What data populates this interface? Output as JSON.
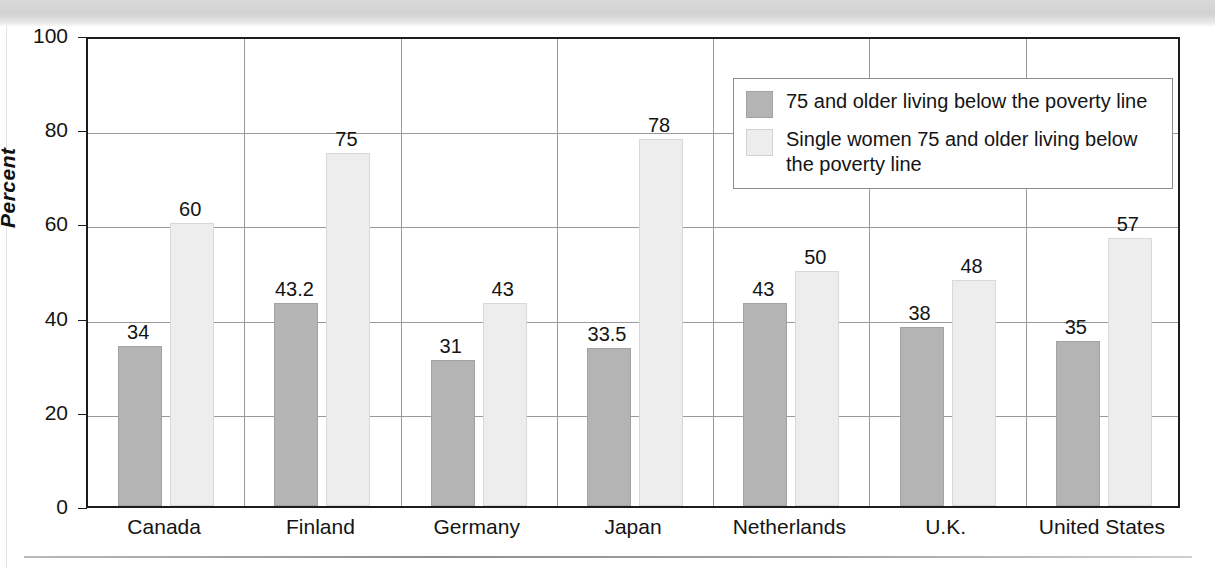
{
  "chart_data": {
    "type": "bar",
    "title": "",
    "xlabel": "",
    "ylabel": "Percent",
    "ylim": [
      0,
      100
    ],
    "yticks": [
      0,
      20,
      40,
      60,
      80,
      100
    ],
    "grid": true,
    "legend_position": "top-right",
    "categories": [
      "Canada",
      "Finland",
      "Germany",
      "Japan",
      "Netherlands",
      "U.K.",
      "United States"
    ],
    "series": [
      {
        "name": "75 and older living below the poverty line",
        "color": "#b4b4b4",
        "values": [
          34,
          43.2,
          31,
          33.5,
          43,
          38,
          35
        ],
        "labels": [
          "34",
          "43.2",
          "31",
          "33.5",
          "43",
          "38",
          "35"
        ]
      },
      {
        "name": "Single women 75 and older living below the poverty line",
        "color": "#ededed",
        "values": [
          60,
          75,
          43,
          78,
          50,
          48,
          57
        ],
        "labels": [
          "60",
          "75",
          "43",
          "78",
          "50",
          "48",
          "57"
        ]
      }
    ]
  },
  "legend": {
    "entries": [
      "75 and older living below the poverty line",
      "Single women 75 and older living below the poverty line"
    ]
  }
}
